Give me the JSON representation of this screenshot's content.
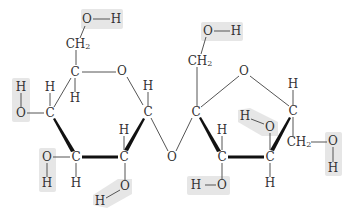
{
  "diagram": {
    "type": "chemical-structure",
    "colors": {
      "text": "#333333",
      "bond": "#555555",
      "bold_bond": "#111111",
      "highlight": "#e6e6e6",
      "background": "#ffffff"
    },
    "labels": {
      "oxygen": "O",
      "hydrogen": "H",
      "carbon": "C",
      "ch2_c": "CH",
      "ch2_sub": "2"
    },
    "rings": [
      {
        "name": "glucose",
        "atoms": [
          "C1",
          "C2",
          "C3",
          "C4",
          "C5",
          "O-ring"
        ]
      },
      {
        "name": "fructose",
        "atoms": [
          "C2'",
          "C3'",
          "C4'",
          "C5'",
          "O-ring"
        ]
      }
    ],
    "hydroxyl_groups_highlighted": 8,
    "glycosidic_bridge": "O"
  }
}
